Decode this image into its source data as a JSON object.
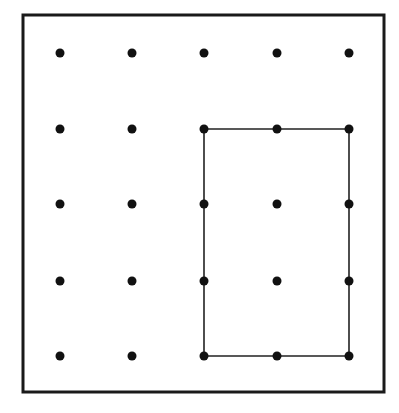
{
  "diagram": {
    "frame": {
      "x1": 23,
      "y1": 15,
      "x2": 384,
      "y2": 392,
      "stroke": "#1a1a1a",
      "width": 3
    },
    "grid": {
      "cols": [
        60,
        132,
        204,
        277,
        349
      ],
      "rows": [
        53,
        129,
        204,
        281,
        356
      ],
      "dot_radius": 4.5,
      "dot_color": "#111111"
    },
    "rectangle": {
      "from": {
        "col": 3,
        "row": 2
      },
      "to": {
        "col": 5,
        "row": 5
      },
      "stroke": "#222222",
      "width": 1.6
    }
  }
}
